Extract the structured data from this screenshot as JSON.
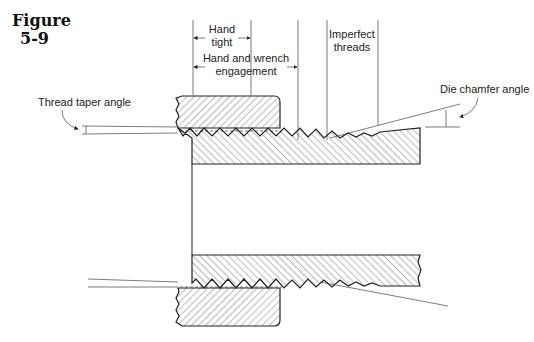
{
  "figure": {
    "label": "Figure",
    "number": "5-9"
  },
  "labels": {
    "hand_tight_1": "Hand",
    "hand_tight_2": "tight",
    "hand_wrench_1": "Hand and wrench",
    "hand_wrench_2": "engagement",
    "imperfect_1": "Imperfect",
    "imperfect_2": "threads",
    "thread_taper_angle": "Thread taper angle",
    "die_chamfer_angle": "Die chamfer angle"
  }
}
